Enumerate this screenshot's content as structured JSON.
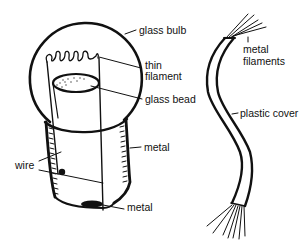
{
  "diagram": {
    "bulb": {
      "labels": {
        "glass_bulb": "glass bulb",
        "thin_filament_line1": "thin",
        "thin_filament_line2": "filament",
        "glass_bead": "glass bead",
        "metal_side": "metal",
        "wire": "wire",
        "metal_bottom": "metal"
      }
    },
    "cable": {
      "labels": {
        "metal_filaments_line1": "metal",
        "metal_filaments_line2": "filaments",
        "plastic_cover": "plastic cover"
      }
    },
    "colors": {
      "ink": "#111111",
      "background": "#ffffff"
    }
  }
}
